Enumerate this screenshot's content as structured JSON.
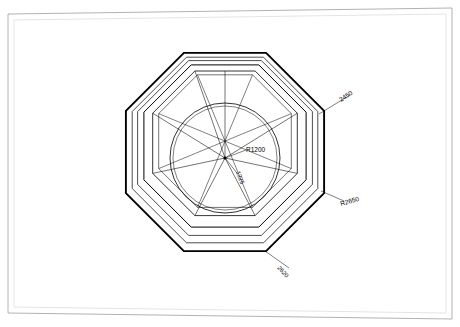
{
  "drawing": {
    "title": "Octagonal window frame plan",
    "background_color": "#ffffff",
    "border_color": "#9a9a9a",
    "line_color": "#000000",
    "thin_line_color": "#555555",
    "sheet": {
      "outer_border": true,
      "inner_border": true
    }
  },
  "dimensions": [
    {
      "id": "dim-2450",
      "text": "2450",
      "leader": "upper-right",
      "rotation": -33
    },
    {
      "id": "dim-r2650",
      "text": "R2650",
      "leader": "right",
      "rotation": -18
    },
    {
      "id": "dim-2620",
      "text": "2620",
      "leader": "lower-right",
      "rotation": 50
    },
    {
      "id": "dim-r1200",
      "text": "R1200",
      "leader": "center-right",
      "rotation": 0
    },
    {
      "id": "dim-1225",
      "text": "1225",
      "leader": "center-down",
      "rotation": 72
    }
  ],
  "geometry": {
    "center": {
      "x": 225,
      "y": 158
    },
    "octagon_outer_radius": 110,
    "octagon_mid_radius": 103,
    "octagon_inner_radius": 96,
    "panel_radius": 84,
    "circle_radius": 54,
    "spoke_count": 8,
    "rotation_deg": 22.5
  }
}
